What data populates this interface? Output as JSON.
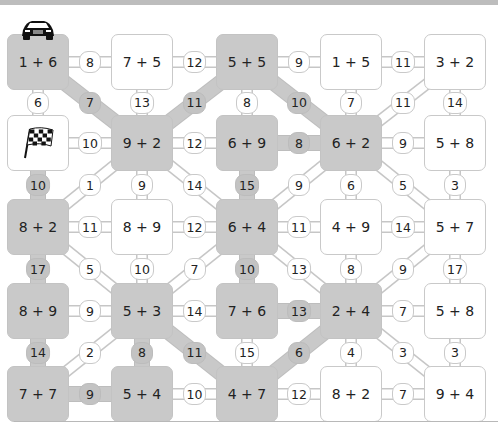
{
  "puzzle": {
    "colors": {
      "path": "#c9c9c9",
      "box_white": "#ffffff",
      "border": "#c9c9c9",
      "text": "#222222"
    },
    "icons": {
      "start": "race-car-icon",
      "finish": "checkered-flag-icon"
    },
    "boxes": [
      {
        "id": "r0c0",
        "row": 0,
        "col": 0,
        "label": "1 + 6",
        "shaded": true,
        "icon": "race-car-icon"
      },
      {
        "id": "r0c1",
        "row": 0,
        "col": 1,
        "label": "7 + 5",
        "shaded": false
      },
      {
        "id": "r0c2",
        "row": 0,
        "col": 2,
        "label": "5 + 5",
        "shaded": true
      },
      {
        "id": "r0c3",
        "row": 0,
        "col": 3,
        "label": "1 + 5",
        "shaded": false
      },
      {
        "id": "r0c4",
        "row": 0,
        "col": 4,
        "label": "3 + 2",
        "shaded": false
      },
      {
        "id": "r1c0",
        "row": 1,
        "col": 0,
        "label": "",
        "shaded": false,
        "icon": "checkered-flag-icon"
      },
      {
        "id": "r1c1",
        "row": 1,
        "col": 1,
        "label": "9 + 2",
        "shaded": true
      },
      {
        "id": "r1c2",
        "row": 1,
        "col": 2,
        "label": "6 + 9",
        "shaded": true
      },
      {
        "id": "r1c3",
        "row": 1,
        "col": 3,
        "label": "6 + 2",
        "shaded": true
      },
      {
        "id": "r1c4",
        "row": 1,
        "col": 4,
        "label": "5 + 8",
        "shaded": false
      },
      {
        "id": "r2c0",
        "row": 2,
        "col": 0,
        "label": "8 + 2",
        "shaded": true
      },
      {
        "id": "r2c1",
        "row": 2,
        "col": 1,
        "label": "8 + 9",
        "shaded": false
      },
      {
        "id": "r2c2",
        "row": 2,
        "col": 2,
        "label": "6 + 4",
        "shaded": true
      },
      {
        "id": "r2c3",
        "row": 2,
        "col": 3,
        "label": "4 + 9",
        "shaded": false
      },
      {
        "id": "r2c4",
        "row": 2,
        "col": 4,
        "label": "5 + 7",
        "shaded": false
      },
      {
        "id": "r3c0",
        "row": 3,
        "col": 0,
        "label": "8 + 9",
        "shaded": true
      },
      {
        "id": "r3c1",
        "row": 3,
        "col": 1,
        "label": "5 + 3",
        "shaded": true
      },
      {
        "id": "r3c2",
        "row": 3,
        "col": 2,
        "label": "7 + 6",
        "shaded": true
      },
      {
        "id": "r3c3",
        "row": 3,
        "col": 3,
        "label": "2 + 4",
        "shaded": true
      },
      {
        "id": "r3c4",
        "row": 3,
        "col": 4,
        "label": "5 + 8",
        "shaded": false
      },
      {
        "id": "r4c0",
        "row": 4,
        "col": 0,
        "label": "7 + 7",
        "shaded": true
      },
      {
        "id": "r4c1",
        "row": 4,
        "col": 1,
        "label": "5 + 4",
        "shaded": true
      },
      {
        "id": "r4c2",
        "row": 4,
        "col": 2,
        "label": "4 + 7",
        "shaded": true
      },
      {
        "id": "r4c3",
        "row": 4,
        "col": 3,
        "label": "8 + 2",
        "shaded": false
      },
      {
        "id": "r4c4",
        "row": 4,
        "col": 4,
        "label": "9 + 4",
        "shaded": false
      }
    ],
    "edges": [
      {
        "from": "r0c0",
        "to": "r0c1",
        "value": "8",
        "shaded": false
      },
      {
        "from": "r0c1",
        "to": "r0c2",
        "value": "12",
        "shaded": false
      },
      {
        "from": "r0c2",
        "to": "r0c3",
        "value": "9",
        "shaded": false
      },
      {
        "from": "r0c3",
        "to": "r0c4",
        "value": "11",
        "shaded": false
      },
      {
        "from": "r0c0",
        "to": "r1c0",
        "value": "6",
        "shaded": false
      },
      {
        "from": "r0c0",
        "to": "r1c1",
        "value": "7",
        "shaded": true
      },
      {
        "from": "r0c1",
        "to": "r1c1",
        "value": "13",
        "shaded": false
      },
      {
        "from": "r0c2",
        "to": "r1c1",
        "value": "11",
        "shaded": true
      },
      {
        "from": "r0c2",
        "to": "r1c2",
        "value": "8",
        "shaded": false
      },
      {
        "from": "r0c2",
        "to": "r1c3",
        "value": "10",
        "shaded": true
      },
      {
        "from": "r0c3",
        "to": "r1c3",
        "value": "7",
        "shaded": false
      },
      {
        "from": "r0c4",
        "to": "r1c3",
        "value": "11",
        "shaded": false
      },
      {
        "from": "r0c4",
        "to": "r1c4",
        "value": "14",
        "shaded": false
      },
      {
        "from": "r1c0",
        "to": "r1c1",
        "value": "10",
        "shaded": false
      },
      {
        "from": "r1c1",
        "to": "r1c2",
        "value": "12",
        "shaded": false
      },
      {
        "from": "r1c2",
        "to": "r1c3",
        "value": "8",
        "shaded": true
      },
      {
        "from": "r1c3",
        "to": "r1c4",
        "value": "9",
        "shaded": false
      },
      {
        "from": "r1c0",
        "to": "r2c0",
        "value": "10",
        "shaded": true
      },
      {
        "from": "r1c1",
        "to": "r2c0",
        "value": "1",
        "shaded": false
      },
      {
        "from": "r1c1",
        "to": "r2c1",
        "value": "9",
        "shaded": false
      },
      {
        "from": "r1c1",
        "to": "r2c2",
        "value": "14",
        "shaded": false
      },
      {
        "from": "r1c2",
        "to": "r2c2",
        "value": "15",
        "shaded": true
      },
      {
        "from": "r1c3",
        "to": "r2c2",
        "value": "9",
        "shaded": false
      },
      {
        "from": "r1c3",
        "to": "r2c3",
        "value": "6",
        "shaded": false
      },
      {
        "from": "r1c3",
        "to": "r2c4",
        "value": "5",
        "shaded": false
      },
      {
        "from": "r1c4",
        "to": "r2c4",
        "value": "3",
        "shaded": false
      },
      {
        "from": "r2c0",
        "to": "r2c1",
        "value": "11",
        "shaded": false
      },
      {
        "from": "r2c1",
        "to": "r2c2",
        "value": "12",
        "shaded": false
      },
      {
        "from": "r2c2",
        "to": "r2c3",
        "value": "11",
        "shaded": false
      },
      {
        "from": "r2c3",
        "to": "r2c4",
        "value": "14",
        "shaded": false
      },
      {
        "from": "r2c0",
        "to": "r3c0",
        "value": "17",
        "shaded": true
      },
      {
        "from": "r2c0",
        "to": "r3c1",
        "value": "5",
        "shaded": false
      },
      {
        "from": "r2c1",
        "to": "r3c1",
        "value": "10",
        "shaded": false
      },
      {
        "from": "r2c2",
        "to": "r3c1",
        "value": "7",
        "shaded": false
      },
      {
        "from": "r2c2",
        "to": "r3c2",
        "value": "10",
        "shaded": true
      },
      {
        "from": "r2c2",
        "to": "r3c3",
        "value": "13",
        "shaded": false
      },
      {
        "from": "r2c3",
        "to": "r3c3",
        "value": "8",
        "shaded": false
      },
      {
        "from": "r2c4",
        "to": "r3c3",
        "value": "9",
        "shaded": false
      },
      {
        "from": "r2c4",
        "to": "r3c4",
        "value": "17",
        "shaded": false
      },
      {
        "from": "r3c0",
        "to": "r3c1",
        "value": "9",
        "shaded": false
      },
      {
        "from": "r3c1",
        "to": "r3c2",
        "value": "14",
        "shaded": false
      },
      {
        "from": "r3c2",
        "to": "r3c3",
        "value": "13",
        "shaded": true
      },
      {
        "from": "r3c3",
        "to": "r3c4",
        "value": "7",
        "shaded": false
      },
      {
        "from": "r3c0",
        "to": "r4c0",
        "value": "14",
        "shaded": true
      },
      {
        "from": "r3c1",
        "to": "r4c0",
        "value": "2",
        "shaded": false
      },
      {
        "from": "r3c1",
        "to": "r4c1",
        "value": "8",
        "shaded": true
      },
      {
        "from": "r3c1",
        "to": "r4c2",
        "value": "11",
        "shaded": true
      },
      {
        "from": "r3c2",
        "to": "r4c2",
        "value": "15",
        "shaded": false
      },
      {
        "from": "r3c3",
        "to": "r4c2",
        "value": "6",
        "shaded": true
      },
      {
        "from": "r3c3",
        "to": "r4c3",
        "value": "4",
        "shaded": false
      },
      {
        "from": "r3c3",
        "to": "r4c4",
        "value": "3",
        "shaded": false
      },
      {
        "from": "r3c4",
        "to": "r4c4",
        "value": "3",
        "shaded": false
      },
      {
        "from": "r4c0",
        "to": "r4c1",
        "value": "9",
        "shaded": true
      },
      {
        "from": "r4c1",
        "to": "r4c2",
        "value": "10",
        "shaded": false
      },
      {
        "from": "r4c2",
        "to": "r4c3",
        "value": "12",
        "shaded": false
      },
      {
        "from": "r4c3",
        "to": "r4c4",
        "value": "7",
        "shaded": false
      }
    ]
  }
}
